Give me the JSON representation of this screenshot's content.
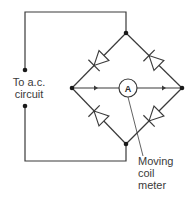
{
  "diagram": {
    "source_label": [
      "To a.c.",
      "circuit"
    ],
    "meter_symbol": "A",
    "meter_label": [
      "Moving",
      "coil",
      "meter"
    ],
    "colors": {
      "line": "#3a3a3a",
      "background": "#ffffff"
    },
    "nodes": {
      "top": [
        126,
        33
      ],
      "bottom": [
        126,
        144
      ],
      "left": [
        72,
        88
      ],
      "right": [
        182,
        88
      ],
      "terminal_top": [
        25,
        70
      ],
      "terminal_bottom": [
        25,
        106
      ]
    },
    "diodes": [
      {
        "name": "upper-left",
        "from": "top",
        "to": "left"
      },
      {
        "name": "upper-right",
        "from": "right",
        "to": "top"
      },
      {
        "name": "lower-left",
        "from": "bottom",
        "to": "left"
      },
      {
        "name": "lower-right",
        "from": "right",
        "to": "bottom"
      }
    ],
    "current_arrows": [
      "left-to-meter",
      "meter-to-right"
    ]
  }
}
